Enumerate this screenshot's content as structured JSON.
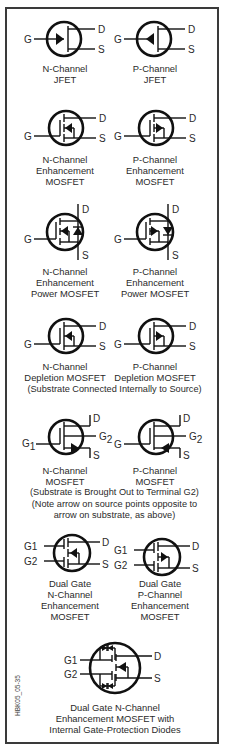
{
  "figure_code": "HBK05_05-35",
  "colors": {
    "ink": "#111111",
    "border": "#3a3a3a",
    "background": "#ffffff"
  },
  "symbols": [
    {
      "id": "n-jfet",
      "caption": [
        "N-Channel",
        "JFET"
      ],
      "pins": {
        "gate": "G",
        "drain": "D",
        "source": "S"
      }
    },
    {
      "id": "p-jfet",
      "caption": [
        "P-Channel",
        "JFET"
      ],
      "pins": {
        "gate": "G",
        "drain": "D",
        "source": "S"
      }
    },
    {
      "id": "n-enh-mosfet",
      "caption": [
        "N-Channel",
        "Enhancement",
        "MOSFET"
      ],
      "pins": {
        "gate": "G",
        "drain": "D",
        "source": "S"
      }
    },
    {
      "id": "p-enh-mosfet",
      "caption": [
        "P-Channel",
        "Enhancement",
        "MOSFET"
      ],
      "pins": {
        "gate": "G",
        "drain": "D",
        "source": "S"
      }
    },
    {
      "id": "n-enh-power-mosfet",
      "caption": [
        "N-Channel",
        "Enhancement",
        "Power MOSFET"
      ],
      "pins": {
        "gate": "G",
        "drain": "D",
        "source": "S"
      }
    },
    {
      "id": "p-enh-power-mosfet",
      "caption": [
        "P-Channel",
        "Enhancement",
        "Power MOSFET"
      ],
      "pins": {
        "gate": "G",
        "drain": "D",
        "source": "S"
      }
    },
    {
      "id": "n-depl-mosfet",
      "caption": [
        "N-Channel",
        "Depletion MOSFET"
      ],
      "pins": {
        "gate": "G",
        "drain": "D",
        "source": "S"
      }
    },
    {
      "id": "p-depl-mosfet",
      "caption": [
        "P-Channel",
        "Depletion MOSFET"
      ],
      "pins": {
        "gate": "G",
        "drain": "D",
        "source": "S"
      }
    },
    {
      "id": "n-mosfet-g2",
      "caption": [
        "N-Channel",
        "MOSFET"
      ],
      "pins": {
        "gate": "G",
        "gate_sub": "1",
        "g2": "G",
        "g2_sub": "2",
        "drain": "D",
        "source": "S"
      }
    },
    {
      "id": "p-mosfet-g2",
      "caption": [
        "P-Channel",
        "MOSFET"
      ],
      "pins": {
        "gate": "G",
        "g2": "G",
        "g2_sub": "2",
        "drain": "D",
        "source": "S"
      }
    },
    {
      "id": "dual-gate-n",
      "caption": [
        "Dual Gate",
        "N-Channel",
        "Enhancement",
        "MOSFET"
      ],
      "pins": {
        "g1": "G1",
        "g2": "G2",
        "drain": "D",
        "source": "S"
      }
    },
    {
      "id": "dual-gate-p",
      "caption": [
        "Dual Gate",
        "P-Channel",
        "Enhancement",
        "MOSFET"
      ],
      "pins": {
        "g1": "G1",
        "g2": "G2",
        "drain": "D",
        "source": "S"
      }
    },
    {
      "id": "dual-gate-n-protected",
      "caption": [
        "Dual Gate N-Channel",
        "Enhancement MOSFET with",
        "Internal Gate-Protection Diodes"
      ],
      "pins": {
        "g1": "G1",
        "g2": "G2",
        "drain": "D",
        "source": "S"
      }
    }
  ],
  "notes": {
    "depletion": "(Substrate Connected Internally to Source)",
    "g2_line1": "(Substrate is Brought Out to Terminal G2)",
    "g2_line2": "(Note arrow on source points opposite to",
    "g2_line3": "arrow on substrate, as above)"
  }
}
